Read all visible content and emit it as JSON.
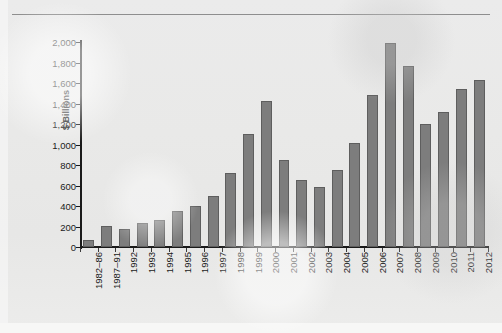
{
  "chart_data": {
    "type": "bar",
    "title": "",
    "subtitle": "",
    "xlabel": "",
    "ylabel": "$ Billions",
    "ylim": [
      0,
      2000
    ],
    "ytick_step": 200,
    "grid": false,
    "legend": null,
    "bar_color": "#7d7d7d",
    "bar_border_color": "#5e5e5e",
    "axis_color": "#1a1a1a",
    "background_color": "#e9e9e8",
    "categories": [
      "1982–86",
      "1987–91",
      "1992",
      "1993",
      "1994",
      "1995",
      "1996",
      "1997",
      "1998",
      "1999",
      "2000",
      "2001",
      "2002",
      "2003",
      "2004",
      "2005",
      "2006",
      "2007",
      "2008",
      "2009",
      "2010",
      "2011",
      "2012"
    ],
    "values": [
      65,
      205,
      175,
      235,
      265,
      355,
      405,
      500,
      725,
      1100,
      1420,
      845,
      650,
      590,
      755,
      1010,
      1485,
      1995,
      1765,
      1205,
      1315,
      1540,
      1630
    ],
    "ytick_labels": [
      "0",
      "200",
      "400",
      "600",
      "800",
      "1,000",
      "1,200",
      "1,400",
      "1,600",
      "1,800",
      "2,000"
    ],
    "ytick_values": [
      0,
      200,
      400,
      600,
      800,
      1000,
      1200,
      1400,
      1600,
      1800,
      2000
    ]
  }
}
